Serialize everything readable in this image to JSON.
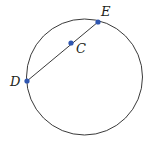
{
  "diagram": {
    "type": "geometry-circle-chord",
    "circle": {
      "cx": 84.5,
      "cy": 77,
      "r": 58,
      "stroke": "#3a3a3a"
    },
    "segment": {
      "from": "D",
      "to": "E",
      "stroke": "#3a3a3a"
    },
    "point_color": "#2f56b0",
    "points": [
      {
        "id": "D",
        "label": "D",
        "x": 27,
        "y": 81,
        "lx": 10,
        "ly": 86
      },
      {
        "id": "C",
        "label": "C",
        "x": 71,
        "y": 43,
        "lx": 76,
        "ly": 53
      },
      {
        "id": "E",
        "label": "E",
        "x": 98,
        "y": 22,
        "lx": 101,
        "ly": 16
      }
    ]
  }
}
